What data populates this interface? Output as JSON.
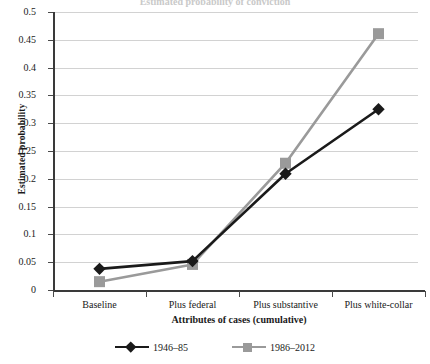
{
  "chart_data": {
    "type": "line",
    "title": "",
    "xlabel": "Attributes of cases (cumulative)",
    "ylabel": "Estimated probability",
    "categories": [
      "Baseline",
      "Plus federal",
      "Plus substantive",
      "Plus white-collar"
    ],
    "ylim": [
      0,
      0.5
    ],
    "ytick_step": 0.05,
    "yticks": [
      "0.5",
      "0.45",
      "0.4",
      "0.35",
      "0.3",
      "0.25",
      "0.2",
      "0.15",
      "0.1",
      "0.05",
      "0"
    ],
    "ytick_values": [
      0.5,
      0.45,
      0.4,
      0.35,
      0.3,
      0.25,
      0.2,
      0.15,
      0.1,
      0.05,
      0
    ],
    "grid": true,
    "legend_position": "bottom",
    "series": [
      {
        "name": "1946–85",
        "color": "#1a1a1a",
        "marker": "diamond",
        "values": [
          0.038,
          0.052,
          0.209,
          0.325
        ]
      },
      {
        "name": "1986–2012",
        "color": "#9a9a9a",
        "marker": "square",
        "values": [
          0.015,
          0.046,
          0.228,
          0.461
        ]
      }
    ]
  },
  "axes": {
    "y_title": "Estimated probability",
    "x_title": "Attributes of cases (cumulative)"
  },
  "legend": {
    "entries": [
      {
        "label": "1946–85",
        "color": "#1a1a1a",
        "marker": "diamond"
      },
      {
        "label": "1986–2012",
        "color": "#9a9a9a",
        "marker": "square"
      }
    ]
  },
  "header": {
    "clipped_title": "Estimated probability of conviction"
  },
  "colors": {
    "series_old": "#1a1a1a",
    "series_new": "#9a9a9a",
    "gridline": "#d2d2d2",
    "axis": "#3a3a3a",
    "background": "#ffffff"
  }
}
